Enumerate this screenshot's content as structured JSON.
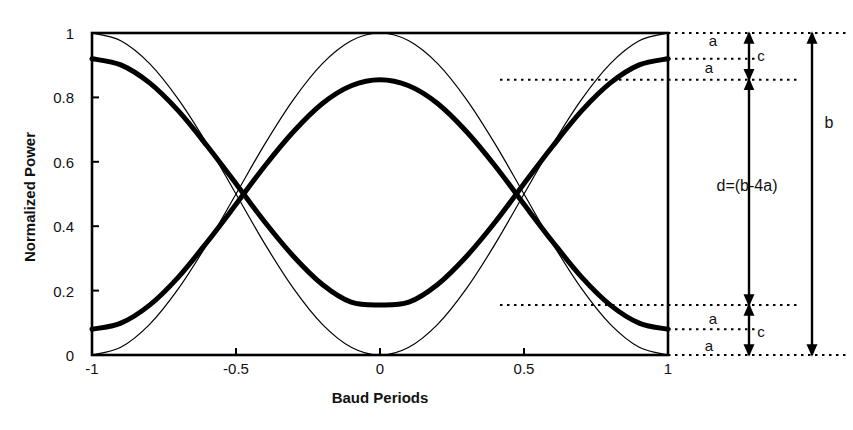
{
  "chart_data": {
    "type": "line",
    "title": "",
    "xlabel": "Baud Periods",
    "ylabel": "Normalized Power",
    "xlim": [
      -1,
      1
    ],
    "ylim": [
      0,
      1
    ],
    "xticks": [
      -1,
      -0.5,
      0,
      0.5,
      1
    ],
    "xtick_labels": [
      "-1",
      "-0.5",
      "0",
      "0.5",
      "1"
    ],
    "yticks": [
      0,
      0.2,
      0.4,
      0.6,
      0.8,
      1
    ],
    "ytick_labels": [
      "0",
      "0.2",
      "0.4",
      "0.6",
      "0.8",
      "1"
    ],
    "grid": false,
    "legend": null,
    "series": [
      {
        "name": "ideal-eye-upper",
        "style": "thin",
        "linewidth": 1.2,
        "color": "#000000",
        "description": "Ideal raised-cosine eye trace rising from 0 at x=-1 to 1 at x=0 and back to 0 at x=1",
        "x": [
          -1,
          -0.9,
          -0.8,
          -0.7,
          -0.6,
          -0.5,
          -0.4,
          -0.3,
          -0.2,
          -0.1,
          0,
          0.1,
          0.2,
          0.3,
          0.4,
          0.5,
          0.6,
          0.7,
          0.8,
          0.9,
          1
        ],
        "y": [
          0,
          0.024,
          0.095,
          0.206,
          0.345,
          0.5,
          0.655,
          0.794,
          0.905,
          0.976,
          1,
          0.976,
          0.905,
          0.794,
          0.655,
          0.5,
          0.345,
          0.206,
          0.095,
          0.024,
          0
        ]
      },
      {
        "name": "ideal-eye-lower",
        "style": "thin",
        "linewidth": 1.2,
        "color": "#000000",
        "description": "Ideal raised-cosine eye trace falling from 1 at x=-1 to 0 at x=0 and back to 1 at x=1",
        "x": [
          -1,
          -0.9,
          -0.8,
          -0.7,
          -0.6,
          -0.5,
          -0.4,
          -0.3,
          -0.2,
          -0.1,
          0,
          0.1,
          0.2,
          0.3,
          0.4,
          0.5,
          0.6,
          0.7,
          0.8,
          0.9,
          1
        ],
        "y": [
          1,
          0.976,
          0.905,
          0.794,
          0.655,
          0.5,
          0.345,
          0.206,
          0.095,
          0.024,
          0,
          0.024,
          0.095,
          0.206,
          0.345,
          0.5,
          0.655,
          0.794,
          0.905,
          0.976,
          1
        ]
      },
      {
        "name": "degraded-eye-upper",
        "style": "thick",
        "linewidth": 5,
        "color": "#000000",
        "description": "Degraded eye trace with reduced amplitude, rising from 0.08 at x=-1 to 0.855 at x=0 and back to 0.08 at x=1",
        "x": [
          -1,
          -0.9,
          -0.8,
          -0.7,
          -0.6,
          -0.5,
          -0.4,
          -0.3,
          -0.2,
          -0.1,
          0,
          0.1,
          0.2,
          0.3,
          0.4,
          0.5,
          0.6,
          0.7,
          0.8,
          0.9,
          1
        ],
        "y": [
          0.08,
          0.099,
          0.155,
          0.242,
          0.351,
          0.468,
          0.587,
          0.694,
          0.781,
          0.836,
          0.855,
          0.836,
          0.781,
          0.694,
          0.587,
          0.468,
          0.351,
          0.242,
          0.155,
          0.099,
          0.08
        ]
      },
      {
        "name": "degraded-eye-lower",
        "style": "thick",
        "linewidth": 5,
        "color": "#000000",
        "description": "Degraded eye trace with reduced amplitude, falling from 0.92 at x=-1 to 0.155 at x=0 and back to 0.92 at x=1",
        "x": [
          -1,
          -0.9,
          -0.8,
          -0.7,
          -0.6,
          -0.5,
          -0.4,
          -0.3,
          -0.2,
          -0.1,
          0,
          0.1,
          0.2,
          0.3,
          0.4,
          0.5,
          0.6,
          0.7,
          0.8,
          0.9,
          1
        ],
        "y": [
          0.92,
          0.901,
          0.845,
          0.758,
          0.649,
          0.532,
          0.413,
          0.306,
          0.219,
          0.164,
          0.155,
          0.164,
          0.219,
          0.306,
          0.413,
          0.532,
          0.649,
          0.758,
          0.845,
          0.901,
          0.92
        ]
      }
    ],
    "crossing_points": [
      {
        "x": -0.5,
        "y": 0.5
      },
      {
        "x": 0.5,
        "y": 0.5
      }
    ],
    "reference_levels": [
      {
        "name": "ideal-high",
        "y": 1.0
      },
      {
        "name": "degraded-high-outer",
        "y": 0.92
      },
      {
        "name": "degraded-high-inner",
        "y": 0.855
      },
      {
        "name": "degraded-low-inner",
        "y": 0.155
      },
      {
        "name": "degraded-low-outer",
        "y": 0.08
      },
      {
        "name": "ideal-low",
        "y": 0.0
      }
    ],
    "annotations": [
      {
        "id": "a-top-upper",
        "label": "a",
        "from_y": 1.0,
        "to_y": 0.92
      },
      {
        "id": "c-top",
        "label": "c",
        "from_y": 1.0,
        "to_y": 0.855
      },
      {
        "id": "a-top-lower",
        "label": "a",
        "from_y": 0.92,
        "to_y": 0.855
      },
      {
        "id": "d-middle",
        "label": "d=(b-4a)",
        "from_y": 0.855,
        "to_y": 0.155
      },
      {
        "id": "b-full",
        "label": "b",
        "from_y": 1.0,
        "to_y": 0.0
      },
      {
        "id": "a-bottom-upper",
        "label": "a",
        "from_y": 0.155,
        "to_y": 0.08
      },
      {
        "id": "c-bottom",
        "label": "c",
        "from_y": 0.155,
        "to_y": 0.0
      },
      {
        "id": "a-bottom-lower",
        "label": "a",
        "from_y": 0.08,
        "to_y": 0.0
      }
    ]
  },
  "axes": {
    "x_title": "Baud Periods",
    "y_title": "Normalized Power",
    "x_tick_labels": [
      "-1",
      "-0.5",
      "0",
      "0.5",
      "1"
    ],
    "y_tick_labels": [
      "1",
      "0.8",
      "0.6",
      "0.4",
      "0.2",
      "0"
    ]
  },
  "annotations": {
    "a_top_1": "a",
    "a_top_2": "a",
    "c_top": "c",
    "d_middle": "d=(b-4a)",
    "b_total": "b",
    "a_bottom_1": "a",
    "a_bottom_2": "a",
    "c_bottom": "c"
  },
  "colors": {
    "line": "#000000",
    "axis": "#000000",
    "background": "#ffffff",
    "text": "#111111"
  }
}
